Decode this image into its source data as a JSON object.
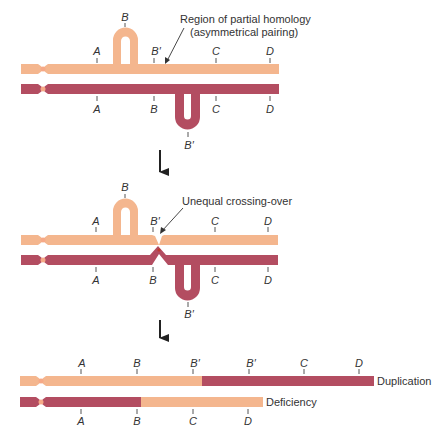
{
  "colors": {
    "light_chromosome": "#f4b68e",
    "dark_chromosome": "#b34d61",
    "centromere_light": "#f6a987",
    "text": "#333333",
    "arrow": "#222222"
  },
  "panel1": {
    "top_genes": [
      "A",
      "B",
      "B′",
      "C",
      "D"
    ],
    "bottom_genes": [
      "A",
      "B",
      "B′",
      "C",
      "D"
    ],
    "annotation_line1": "Region of partial homology",
    "annotation_line2": "(asymmetrical pairing)"
  },
  "panel2": {
    "top_genes": [
      "A",
      "B",
      "B′",
      "C",
      "D"
    ],
    "bottom_genes": [
      "A",
      "B",
      "B′",
      "C",
      "D"
    ],
    "annotation": "Unequal crossing-over"
  },
  "panel3": {
    "top_genes": [
      "A",
      "B",
      "B′",
      "B′",
      "C",
      "D"
    ],
    "bottom_genes": [
      "A",
      "B",
      "C",
      "D"
    ],
    "top_result": "Duplication",
    "bottom_result": "Deficiency"
  }
}
